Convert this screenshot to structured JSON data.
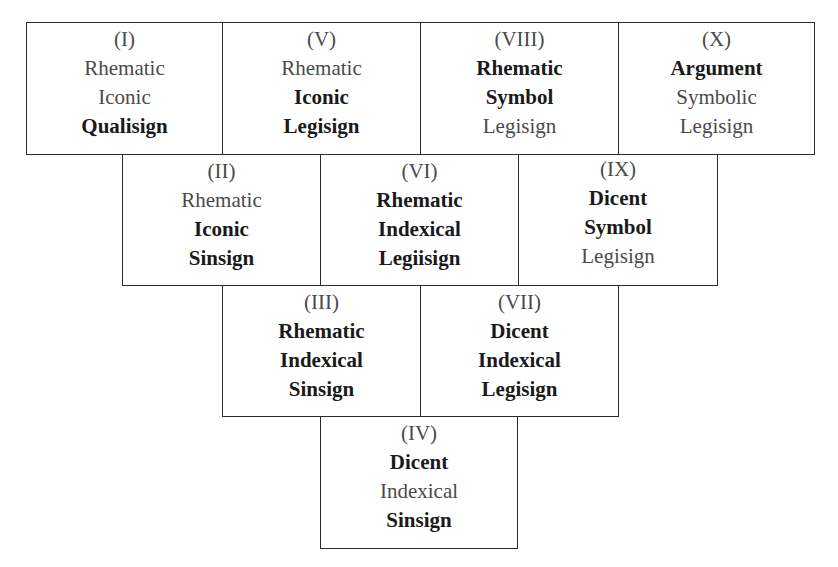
{
  "diagram": {
    "title": "",
    "colors": {
      "border": "#2a2a2a",
      "text_regular": "#4a4a4a",
      "text_bold": "#1a1a1a",
      "background": "#ffffff"
    },
    "boxes": [
      {
        "id": "I",
        "numeral": "(I)",
        "lines": [
          {
            "text": "Rhematic",
            "bold": false
          },
          {
            "text": "Iconic",
            "bold": false
          },
          {
            "text": "Qualisign",
            "bold": true
          }
        ],
        "row": 1,
        "x": 26,
        "y": 22,
        "w": 197,
        "h": 133
      },
      {
        "id": "V",
        "numeral": "(V)",
        "lines": [
          {
            "text": "Rhematic",
            "bold": false
          },
          {
            "text": "Iconic",
            "bold": true
          },
          {
            "text": "Legisign",
            "bold": true
          }
        ],
        "row": 1,
        "x": 222,
        "y": 22,
        "w": 199,
        "h": 133
      },
      {
        "id": "VIII",
        "numeral": "(VIII)",
        "lines": [
          {
            "text": "Rhematic",
            "bold": true
          },
          {
            "text": "Symbol",
            "bold": true
          },
          {
            "text": "Legisign",
            "bold": false
          }
        ],
        "row": 1,
        "x": 420,
        "y": 22,
        "w": 199,
        "h": 133
      },
      {
        "id": "X",
        "numeral": "(X)",
        "lines": [
          {
            "text": "Argument",
            "bold": true
          },
          {
            "text": "Symbolic",
            "bold": false
          },
          {
            "text": "Legisign",
            "bold": false
          }
        ],
        "row": 1,
        "x": 618,
        "y": 22,
        "w": 197,
        "h": 133
      },
      {
        "id": "II",
        "numeral": "(II)",
        "lines": [
          {
            "text": "Rhematic",
            "bold": false
          },
          {
            "text": "Iconic",
            "bold": true
          },
          {
            "text": "Sinsign",
            "bold": true
          }
        ],
        "row": 2,
        "x": 122,
        "y": 154,
        "w": 199,
        "h": 132
      },
      {
        "id": "VI",
        "numeral": "(VI)",
        "lines": [
          {
            "text": "Rhematic",
            "bold": true
          },
          {
            "text": "Indexical",
            "bold": true
          },
          {
            "text": "Legiisign",
            "bold": true
          }
        ],
        "row": 2,
        "x": 320,
        "y": 154,
        "w": 199,
        "h": 132
      },
      {
        "id": "IX",
        "numeral": "(IX)",
        "lines": [
          {
            "text": "Dicent",
            "bold": true
          },
          {
            "text": "Symbol",
            "bold": true
          },
          {
            "text": "Legisign",
            "bold": false
          }
        ],
        "row": 2,
        "x": 518,
        "y": 154,
        "w": 200,
        "h": 132
      },
      {
        "id": "III",
        "numeral": "(III)",
        "lines": [
          {
            "text": "Rhematic",
            "bold": true
          },
          {
            "text": "Indexical",
            "bold": true
          },
          {
            "text": "Sinsign",
            "bold": true
          }
        ],
        "row": 3,
        "x": 222,
        "y": 285,
        "w": 199,
        "h": 132
      },
      {
        "id": "VII",
        "numeral": "(VII)",
        "lines": [
          {
            "text": "Dicent",
            "bold": true
          },
          {
            "text": "Indexical",
            "bold": true
          },
          {
            "text": "Legisign",
            "bold": true
          }
        ],
        "row": 3,
        "x": 420,
        "y": 285,
        "w": 199,
        "h": 132
      },
      {
        "id": "IV",
        "numeral": "(IV)",
        "lines": [
          {
            "text": "Dicent",
            "bold": true
          },
          {
            "text": "Indexical",
            "bold": false
          },
          {
            "text": "Sinsign",
            "bold": true
          }
        ],
        "row": 4,
        "x": 320,
        "y": 416,
        "w": 198,
        "h": 133
      }
    ]
  }
}
